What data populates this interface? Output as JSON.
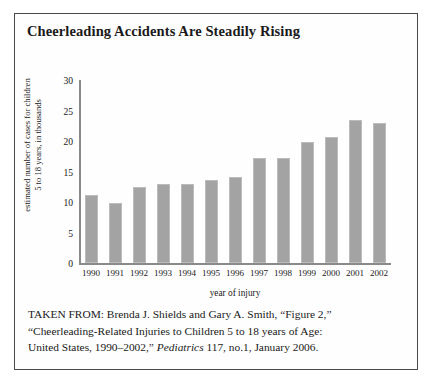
{
  "figure": {
    "title": "Cheerleading Accidents Are Steadily Rising"
  },
  "chart_data": {
    "type": "bar",
    "title": "Cheerleading Accidents Are Steadily Rising",
    "xlabel": "year of injury",
    "ylabel": "estimated number of cases for children 5 to 18 years, in thousands",
    "ylabel_line1": "estimated number of cases for children",
    "ylabel_line2": "5 to 18 years, in thousands",
    "categories": [
      "1990",
      "1991",
      "1992",
      "1993",
      "1994",
      "1995",
      "1996",
      "1997",
      "1998",
      "1999",
      "2000",
      "2001",
      "2002"
    ],
    "values": [
      11.1,
      9.9,
      12.4,
      13.0,
      13.0,
      13.6,
      14.1,
      17.2,
      17.2,
      19.9,
      20.7,
      23.5,
      22.9
    ],
    "ylim": [
      0,
      30
    ],
    "yticks": [
      0,
      5,
      10,
      15,
      20,
      25,
      30
    ],
    "ytick_labels": [
      "0",
      "5",
      "10",
      "15",
      "20",
      "25",
      "30"
    ],
    "grid": false,
    "legend": false,
    "bar_color": "#a3a3a3",
    "axis_color": "#8a8a8a"
  },
  "source_note": {
    "line1": "TAKEN FROM: Brenda J. Shields and Gary A. Smith, “Figure 2,”",
    "line2": "“Cheerleading-Related Injuries to Children 5 to 18 years of Age:",
    "line3_pre": "United States, 1990–2002,” ",
    "line3_italic": "Pediatrics",
    "line3_post": " 117, no.1, January 2006."
  }
}
